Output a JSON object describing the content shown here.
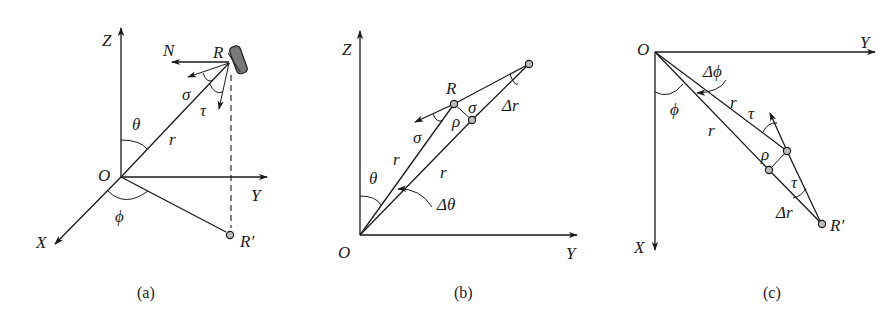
{
  "panels": [
    {
      "id": "a",
      "caption": "(a)",
      "labels": {
        "z_axis": "Z",
        "y_axis": "Y",
        "x_axis": "X",
        "origin": "O",
        "target": "R",
        "projection": "R′",
        "normal": "N",
        "theta": "θ",
        "phi": "ϕ",
        "range": "r",
        "sigma": "σ",
        "tau": "τ"
      }
    },
    {
      "id": "b",
      "caption": "(b)",
      "labels": {
        "z_axis": "Z",
        "y_axis": "Y",
        "origin": "O",
        "target": "R",
        "theta": "θ",
        "delta_theta": "Δθ",
        "range_1": "r",
        "range_2": "r",
        "delta_r": "Δr",
        "rho": "ρ",
        "sigma_1": "σ",
        "sigma_2": "σ"
      }
    },
    {
      "id": "c",
      "caption": "(c)",
      "labels": {
        "y_axis": "Y",
        "x_axis": "X",
        "origin": "O",
        "projection": "R′",
        "phi": "ϕ",
        "delta_phi": "Δϕ",
        "range_1": "r",
        "range_2": "r",
        "delta_r": "Δr",
        "rho": "ρ",
        "tau_1": "τ",
        "tau_2": "τ"
      }
    }
  ]
}
